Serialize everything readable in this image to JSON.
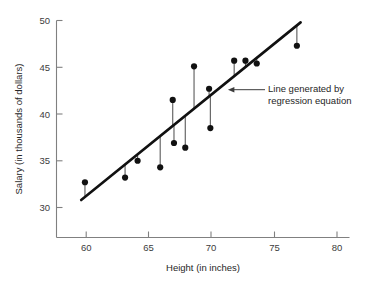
{
  "chart_data": {
    "type": "scatter",
    "title": "",
    "xlabel": "Height (in inches)",
    "ylabel": "Salary (in thousands of dollars)",
    "xlim": [
      57.8,
      82.0
    ],
    "ylim": [
      28.0,
      50.8
    ],
    "xticks": [
      60,
      65,
      70,
      75,
      80
    ],
    "yticks": [
      30,
      35,
      40,
      45,
      50
    ],
    "xticklabels": [
      "60",
      "65",
      "70",
      "75",
      "80"
    ],
    "yticklabels": [
      "30",
      "35",
      "40",
      "45",
      "50"
    ],
    "grid": false,
    "legend": false,
    "points": [
      {
        "x": 59.9,
        "y": 32.7
      },
      {
        "x": 63.1,
        "y": 33.2
      },
      {
        "x": 64.1,
        "y": 35.0
      },
      {
        "x": 65.9,
        "y": 34.3
      },
      {
        "x": 66.9,
        "y": 41.5
      },
      {
        "x": 67.0,
        "y": 36.9
      },
      {
        "x": 67.9,
        "y": 36.4
      },
      {
        "x": 68.6,
        "y": 45.1
      },
      {
        "x": 69.8,
        "y": 42.7
      },
      {
        "x": 69.9,
        "y": 38.5
      },
      {
        "x": 71.8,
        "y": 45.7
      },
      {
        "x": 72.7,
        "y": 45.7
      },
      {
        "x": 73.6,
        "y": 45.4
      },
      {
        "x": 76.8,
        "y": 47.3
      }
    ],
    "residual_stems": true,
    "fit_line": {
      "label": "Line generated by regression equation",
      "x_start": 59.6,
      "y_start": 30.8,
      "x_end": 77.1,
      "y_end": 49.8
    },
    "annotation": {
      "line1": "Line generated by",
      "line2": "regression equation",
      "target_x": 71.3,
      "target_y": 42.6
    },
    "colors": {
      "point": "#111111",
      "line": "#111111",
      "stem": "#5a5a5a",
      "axis": "#808080",
      "text": "#262626",
      "background": "#ffffff"
    }
  }
}
